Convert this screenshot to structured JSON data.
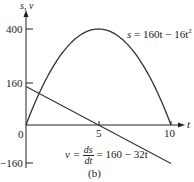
{
  "chart_data": {
    "type": "line",
    "title": "",
    "caption": "(b)",
    "xlabel": "t",
    "ylabel": "s, v",
    "xlim": [
      0,
      11
    ],
    "ylim": [
      -160,
      440
    ],
    "x_ticks": [
      0,
      5,
      10
    ],
    "x_tick_labels": [
      "0",
      "5",
      "10"
    ],
    "y_ticks": [
      -160,
      160,
      400
    ],
    "y_tick_labels": [
      "−160",
      "160",
      "400"
    ],
    "grid": false,
    "series": [
      {
        "name": "s = 160t − 16t²",
        "label_lhs": "s",
        "label_rhs": "160t − 16t",
        "label_sup": "2",
        "x": [
          0,
          1,
          2,
          3,
          4,
          5,
          6,
          7,
          8,
          9,
          10
        ],
        "values": [
          0,
          144,
          256,
          336,
          384,
          400,
          384,
          336,
          256,
          144,
          0
        ]
      },
      {
        "name": "v = ds/dt = 160 − 32t",
        "label_lhs": "v",
        "label_num": "ds",
        "label_den": "dt",
        "label_rhs": "160 − 32t",
        "x": [
          0,
          5,
          10
        ],
        "values": [
          160,
          0,
          -160
        ]
      }
    ]
  },
  "axes": {
    "y_label": "s, v",
    "x_label": "t",
    "origin_label": "0",
    "tick_5": "5",
    "tick_10": "10",
    "tick_400": "400",
    "tick_160": "160",
    "tick_neg160": "−160"
  },
  "labels": {
    "s_lhs": "s",
    "s_rhs": "= 160t − 16t",
    "s_sup": "2",
    "v_lhs": "v =",
    "v_num": "ds",
    "v_den": "dt",
    "v_rhs": "= 160 − 32t",
    "caption": "(b)"
  },
  "colors": {
    "curve": "#333333",
    "axis": "#222222"
  }
}
